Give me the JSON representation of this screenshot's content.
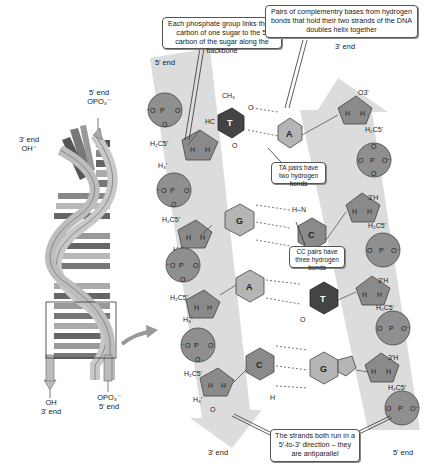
{
  "callouts": {
    "phosphate": "Each phosphate group links the 3' carbon of one sugar to the 5' carbon of the sugar along the backbone",
    "base_pairs": "Pairs of complementry bases from hydrogen bonds that hold their two strands of the DNA doubles helix together",
    "ta_pairs": "TA pairs have two hydrogen bonds",
    "cc_pairs": "CC pairs have three hydrogen bonds",
    "antiparallel": "The strands both run in a 5'-to-3' direction – they are antiparallel"
  },
  "helix_labels": {
    "top_right_end": "5' end",
    "top_right_group": "OPO₃⁻",
    "top_left_end": "3' end",
    "top_left_group": "OH⁻",
    "bottom_left_group": "OH",
    "bottom_left_end": "3' end",
    "bottom_right_group": "OPO₃⁻",
    "bottom_right_end": "5' end"
  },
  "strand_labels": {
    "left_top": "5' end",
    "left_bottom": "3' end",
    "right_top": "3' end",
    "right_bottom": "5' end"
  },
  "bases": {
    "left": [
      "T",
      "G",
      "A",
      "C"
    ],
    "right": [
      "A",
      "C",
      "T",
      "G"
    ]
  },
  "atoms": {
    "phosphorus": "P",
    "oxygen": "O",
    "oxygen_minus": "O⁻",
    "ch2c5": "H₂C 5'",
    "c5h2": "H₂C 5'",
    "h3": "H 3'",
    "o3": "O 3'",
    "h": "H",
    "ch3": "CH₃",
    "nh": "N–H",
    "hn": "H–N"
  },
  "colors": {
    "strand_band": "#dcdcdc",
    "phosphate_fill": "#8f8f8f",
    "sugar_fill": "#8a8a8a",
    "base_T": "#444444",
    "base_light": "#b5b5b5",
    "helix_light": "#c8c8c8",
    "helix_dark": "#6f6f6f"
  }
}
